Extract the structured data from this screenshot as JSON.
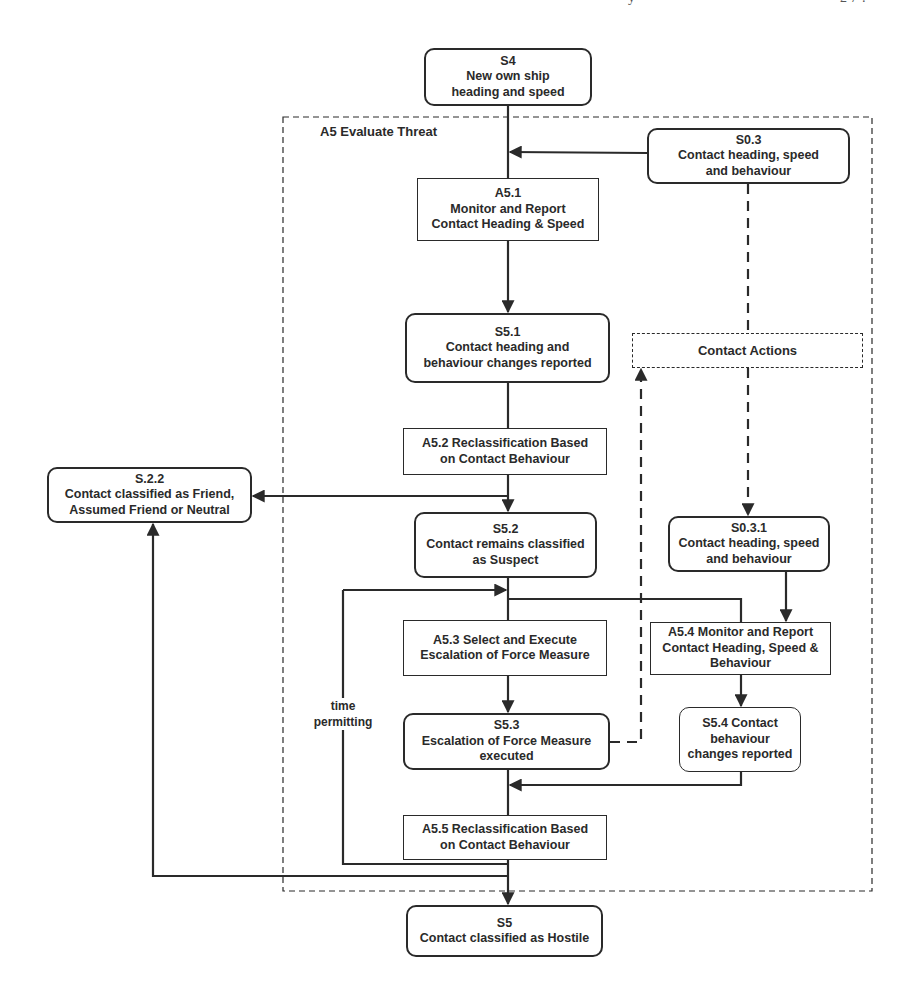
{
  "page_header": {
    "left_fragment": "y",
    "right_fragment": "2 7 ?"
  },
  "container": {
    "title": "A5 Evaluate Threat"
  },
  "nodes": {
    "s4": {
      "id": "S4",
      "lines": [
        "S4",
        "New own ship",
        "heading and speed"
      ],
      "kind": "state"
    },
    "s03": {
      "id": "S0.3",
      "lines": [
        "S0.3",
        "Contact heading, speed",
        "and behaviour"
      ],
      "kind": "state"
    },
    "a51": {
      "id": "A5.1",
      "lines": [
        "A5.1",
        "Monitor and Report",
        "Contact Heading & Speed"
      ],
      "kind": "activity"
    },
    "s51": {
      "id": "S5.1",
      "lines": [
        "S5.1",
        "Contact heading and",
        "behaviour changes reported"
      ],
      "kind": "state"
    },
    "contact_actions": {
      "lines": [
        "Contact Actions"
      ],
      "kind": "dashed"
    },
    "a52": {
      "id": "A5.2",
      "lines": [
        "A5.2 Reclassification Based",
        "on Contact Behaviour"
      ],
      "kind": "activity"
    },
    "s22": {
      "id": "S.2.2",
      "lines": [
        "S.2.2",
        "Contact classified as Friend,",
        "Assumed Friend or Neutral"
      ],
      "kind": "state"
    },
    "s52": {
      "id": "S5.2",
      "lines": [
        "S5.2",
        "Contact remains classified",
        "as Suspect"
      ],
      "kind": "state"
    },
    "s031": {
      "id": "S0.3.1",
      "lines": [
        "S0.3.1",
        "Contact heading, speed",
        "and behaviour"
      ],
      "kind": "state"
    },
    "a53": {
      "id": "A5.3",
      "lines": [
        "A5.3 Select and Execute",
        "Escalation of Force Measure"
      ],
      "kind": "activity"
    },
    "a54": {
      "id": "A5.4",
      "lines": [
        "A5.4 Monitor and Report",
        "Contact Heading, Speed &",
        "Behaviour"
      ],
      "kind": "activity"
    },
    "s53": {
      "id": "S5.3",
      "lines": [
        "S5.3",
        "Escalation of Force Measure",
        "executed"
      ],
      "kind": "state"
    },
    "s54": {
      "id": "S5.4",
      "lines": [
        "S5.4 Contact",
        "behaviour",
        "changes reported"
      ],
      "kind": "state"
    },
    "a55": {
      "id": "A5.5",
      "lines": [
        "A5.5 Reclassification Based",
        "on Contact Behaviour"
      ],
      "kind": "activity"
    },
    "s5": {
      "id": "S5",
      "lines": [
        "S5",
        "Contact classified as Hostile"
      ],
      "kind": "state"
    }
  },
  "edge_labels": {
    "loop": [
      "time",
      "permitting"
    ]
  },
  "edges": [
    {
      "from": "S4",
      "to": "A5.1",
      "style": "solid"
    },
    {
      "from": "S0.3",
      "to": "A5.1",
      "style": "solid"
    },
    {
      "from": "A5.1",
      "to": "S5.1",
      "style": "solid"
    },
    {
      "from": "S0.3",
      "to": "Contact Actions",
      "style": "dashed"
    },
    {
      "from": "Contact Actions",
      "to": "S0.3.1",
      "style": "dashed"
    },
    {
      "from": "S5.1",
      "to": "A5.2",
      "style": "solid"
    },
    {
      "from": "A5.2",
      "to": "S.2.2",
      "style": "solid"
    },
    {
      "from": "A5.2",
      "to": "S5.2",
      "style": "solid"
    },
    {
      "from": "S5.2",
      "to": "A5.3",
      "style": "solid"
    },
    {
      "from": "S5.2",
      "to": "A5.4",
      "style": "solid"
    },
    {
      "from": "S0.3.1",
      "to": "A5.4",
      "style": "solid"
    },
    {
      "from": "A5.3",
      "to": "S5.3",
      "style": "solid"
    },
    {
      "from": "S5.3",
      "to": "Contact Actions",
      "style": "dashed"
    },
    {
      "from": "A5.4",
      "to": "S5.4",
      "style": "solid"
    },
    {
      "from": "S5.4",
      "to": "A5.5",
      "style": "solid"
    },
    {
      "from": "S5.3",
      "to": "A5.5",
      "style": "solid"
    },
    {
      "from": "A5.5",
      "to": "S5.2",
      "style": "solid",
      "label": "time permitting"
    },
    {
      "from": "A5.5",
      "to": "S.2.2",
      "style": "solid"
    },
    {
      "from": "A5.5",
      "to": "S5",
      "style": "solid"
    }
  ],
  "colors": {
    "ink": "#2a2a2a",
    "background": "#ffffff"
  }
}
